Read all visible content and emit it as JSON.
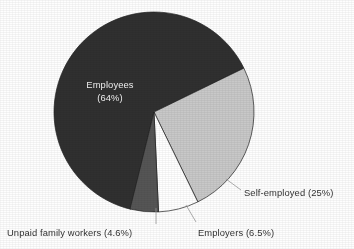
{
  "chart_data": {
    "type": "pie",
    "title": "",
    "subtitle": "",
    "xlabel": "",
    "ylabel": "",
    "legend_position": "none",
    "grid": false,
    "labels_inside": [
      "Employees"
    ],
    "categories": [
      "Employees",
      "Self-employed",
      "Employers",
      "Unpaid family workers"
    ],
    "values": [
      64,
      25,
      6.5,
      4.6
    ],
    "units": "percent",
    "slices": [
      {
        "name": "Employees",
        "value": 64,
        "value_text": "64%",
        "label_line1": "Employees",
        "label_line2": "(64%)",
        "label_full": "Employees (64%)",
        "color": "#303030",
        "label_color": "#f2f2f2",
        "label_placement": "inside",
        "start_angle": 26.0,
        "end_angle": 256.4
      },
      {
        "name": "Self-employed",
        "value": 25,
        "value_text": "25%",
        "label_full": "Self-employed (25%)",
        "color": "#c8c8c8",
        "label_color": "#333333",
        "label_placement": "outside-right",
        "start_angle": -64.0,
        "end_angle": 26.0
      },
      {
        "name": "Employers",
        "value": 6.5,
        "value_text": "6.5%",
        "label_full": "Employers (6.5%)",
        "color": "#ffffff",
        "label_color": "#333333",
        "label_placement": "outside-bottom",
        "start_angle": -87.4,
        "end_angle": -64.0
      },
      {
        "name": "Unpaid family workers",
        "value": 4.6,
        "value_text": "4.6%",
        "label_full": "Unpaid family workers (4.6%)",
        "color": "#555555",
        "label_color": "#333333",
        "label_placement": "outside-bottom-left",
        "start_angle": -103.9,
        "end_angle": -87.4
      }
    ],
    "geometry": {
      "center_x": 154,
      "center_y": 112,
      "radius": 100
    },
    "colors": {
      "employees": "#303030",
      "self_employed": "#c8c8c8",
      "employers": "#ffffff",
      "unpaid_family_workers": "#555555",
      "outline": "#1f1f1f",
      "leader_line": "#9a9a9a",
      "background": "#ffffff",
      "text": "#333333"
    }
  },
  "labels": {
    "employees_line1": "Employees",
    "employees_line2": "(64%)",
    "self_employed": "Self-employed (25%)",
    "employers": "Employers (6.5%)",
    "unpaid_family_workers": "Unpaid family workers (4.6%)"
  }
}
